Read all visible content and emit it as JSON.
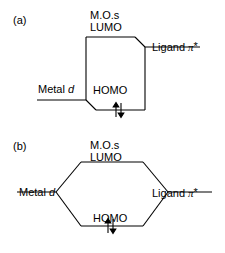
{
  "figure": {
    "type": "molecular-orbital-interaction-diagram",
    "background_color": "#ffffff",
    "line_color": "#000000"
  },
  "panels": [
    {
      "id": "a",
      "label": "(a)",
      "shape": "box",
      "labels": {
        "mos": "M.O.s",
        "lumo": "LUMO",
        "homo": "HOMO",
        "metal_text": "Metal ",
        "metal_orbital": "d",
        "ligand_text": "Ligand ",
        "ligand_orbital": "π",
        "ligand_star": "*"
      },
      "electrons": "↑↓"
    },
    {
      "id": "b",
      "label": "(b)",
      "shape": "hexagon",
      "labels": {
        "mos": "M.O.s",
        "lumo": "LUMO",
        "homo": "HOMO",
        "metal_text": "Metal ",
        "metal_orbital": "d",
        "ligand_text": "Ligand ",
        "ligand_orbital": "π",
        "ligand_star": "*"
      },
      "electrons": "↑↓"
    }
  ]
}
